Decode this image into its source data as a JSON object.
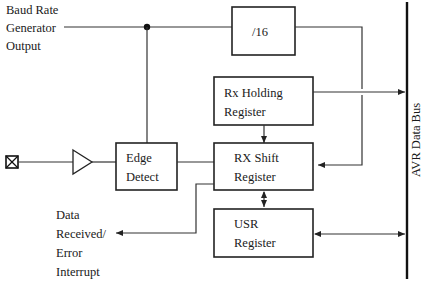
{
  "diagram": {
    "inputs": {
      "baud_rate": [
        "Baud Rate",
        "Generator",
        "Output"
      ],
      "pin_icon": "crossed-box-pin-icon",
      "buffer_icon": "triangle-buffer-icon"
    },
    "blocks": {
      "divider": [
        "/16"
      ],
      "edge_detect": [
        "Edge",
        "Detect"
      ],
      "rx_holding": [
        "Rx Holding",
        "Register"
      ],
      "rx_shift": [
        "RX Shift",
        "Register"
      ],
      "usr": [
        "USR",
        "Register"
      ]
    },
    "outputs": {
      "interrupt": [
        "Data",
        "Received/",
        "Error",
        "Interrupt"
      ]
    },
    "bus": {
      "label": "AVR Data Bus"
    }
  }
}
